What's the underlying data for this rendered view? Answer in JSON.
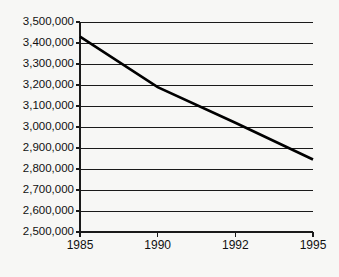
{
  "chart_data": {
    "type": "line",
    "title": "",
    "subtitle": "",
    "xlabel": "",
    "ylabel": "",
    "categories": [
      "1985",
      "1990",
      "1992",
      "1995"
    ],
    "series": [
      {
        "name": "",
        "values": [
          3430000,
          3190000,
          3020000,
          2845000
        ],
        "color": "#000000"
      }
    ],
    "ylim": [
      2500000,
      3500000
    ],
    "ytick_step": 100000,
    "ytick_labels": [
      "2,500,000",
      "2,600,000",
      "2,700,000",
      "2,800,000",
      "2,900,000",
      "3,000,000",
      "3,100,000",
      "3,200,000",
      "3,300,000",
      "3,400,000",
      "3,500,000"
    ],
    "ytick_values": [
      2500000,
      2600000,
      2700000,
      2800000,
      2900000,
      3000000,
      3100000,
      3200000,
      3300000,
      3400000,
      3500000
    ],
    "xtick_labels": [
      "1985",
      "1990",
      "1992",
      "1995"
    ],
    "grid": "horizontal",
    "legend": "none",
    "annotations": [],
    "background_color": "#f7f7f5",
    "axis_color": "#1a1a1a",
    "grid_color": "#1a1a1a",
    "text_color": "#111111"
  },
  "layout": {
    "plot_left": 80,
    "plot_right": 313,
    "plot_top": 22,
    "plot_bottom": 232,
    "canvas_width": 339,
    "canvas_height": 277,
    "xlabel_baseline_y": 240,
    "ytick_label_right": 74
  }
}
